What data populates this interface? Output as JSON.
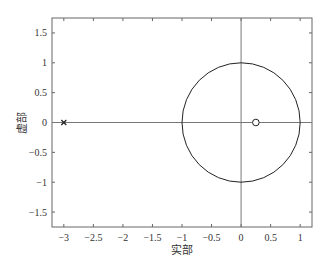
{
  "chart_data": {
    "type": "scatter",
    "title": "",
    "xlabel": "实部",
    "ylabel": "虚部",
    "xlim": [
      -3.2,
      1.2
    ],
    "ylim": [
      -1.75,
      1.75
    ],
    "xticks": [
      -3,
      -2.5,
      -2,
      -1.5,
      -1,
      -0.5,
      0,
      0.5,
      1
    ],
    "xtick_labels": [
      "−3",
      "−2.5",
      "−2",
      "−1.5",
      "−1",
      "−0.5",
      "0",
      "0.5",
      "1"
    ],
    "yticks": [
      1.5,
      1,
      0.5,
      0,
      -0.5,
      -1,
      -1.5
    ],
    "ytick_labels": [
      "1.5",
      "1",
      "0.5",
      "0",
      "−0.5",
      "−1",
      "−1.5"
    ],
    "grid": false,
    "series": [
      {
        "name": "poles",
        "marker": "x",
        "points": [
          [
            -3,
            0
          ]
        ]
      },
      {
        "name": "zeros",
        "marker": "o",
        "points": [
          [
            0.25,
            0
          ]
        ]
      },
      {
        "name": "unit-circle",
        "type": "circle",
        "center": [
          0,
          0
        ],
        "radius": 1
      }
    ]
  }
}
